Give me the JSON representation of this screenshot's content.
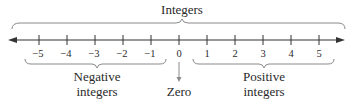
{
  "diagram": {
    "title": "Integers",
    "number_line": {
      "ticks": [
        "−5",
        "−4",
        "−3",
        "−2",
        "−1",
        "0",
        "1",
        "2",
        "3",
        "4",
        "5"
      ],
      "arrows": "both"
    },
    "labels": {
      "negative_line1": "Negative",
      "negative_line2": "integers",
      "zero": "Zero",
      "positive_line1": "Positive",
      "positive_line2": "integers"
    },
    "colors": {
      "line": "#333333",
      "brace": "#8a8a8a",
      "text": "#2a2a2a"
    }
  }
}
